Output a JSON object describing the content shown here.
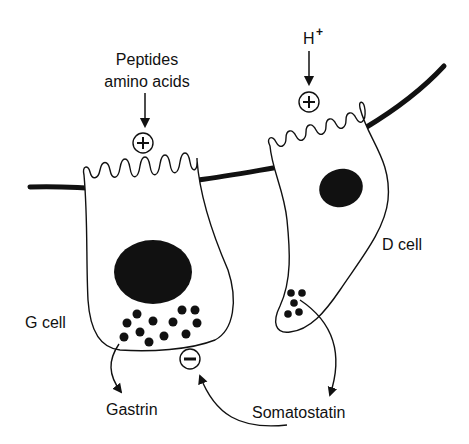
{
  "diagram": {
    "labels": {
      "peptides_line1": "Peptides",
      "peptides_line2": "amino acids",
      "h_plus": "H",
      "h_plus_sup": "+",
      "d_cell": "D cell",
      "g_cell": "G cell",
      "gastrin": "Gastrin",
      "somatostatin": "Somatostatin"
    },
    "symbols": {
      "stimulate_g": "+",
      "stimulate_d": "+",
      "inhibit_g": "−"
    },
    "colors": {
      "ink": "#111111",
      "background": "#ffffff"
    }
  }
}
